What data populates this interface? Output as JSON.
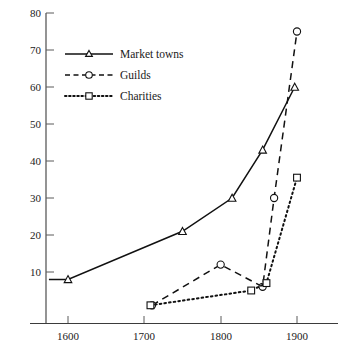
{
  "chart_data": {
    "type": "line",
    "title": "",
    "subtitle": "",
    "xlabel": "",
    "ylabel": "",
    "xlim": [
      1560,
      1935
    ],
    "ylim": [
      0,
      80
    ],
    "grid": false,
    "legend_position": "upper-left-inside",
    "xticks": [
      1600,
      1700,
      1800,
      1900
    ],
    "xtick_labels": [
      "1600",
      "1700",
      "1800",
      "1900"
    ],
    "yticks": [
      10,
      20,
      30,
      40,
      50,
      60,
      70,
      80
    ],
    "ytick_labels": [
      "10",
      "20",
      "30",
      "40",
      "50",
      "60",
      "70",
      "80"
    ],
    "series": [
      {
        "name": "Market towns",
        "marker": "triangle",
        "linestyle": "solid",
        "x": [
          1575,
          1600,
          1750,
          1815,
          1855,
          1897
        ],
        "values": [
          8,
          8,
          21,
          30,
          43,
          60
        ]
      },
      {
        "name": "Guilds",
        "marker": "circle",
        "linestyle": "dashed",
        "x": [
          1710,
          1800,
          1855,
          1870,
          1900
        ],
        "values": [
          1,
          12,
          6,
          30,
          75
        ]
      },
      {
        "name": "Charities",
        "marker": "square",
        "linestyle": "dotted",
        "x": [
          1708,
          1840,
          1860,
          1900
        ],
        "values": [
          1,
          5,
          7,
          35.5
        ]
      }
    ]
  },
  "legend": {
    "items": [
      {
        "label": "Market towns",
        "marker": "triangle-marker",
        "linestyle": "solid"
      },
      {
        "label": "Guilds",
        "marker": "circle-marker",
        "linestyle": "dashed"
      },
      {
        "label": "Charities",
        "marker": "square-marker",
        "linestyle": "dotted"
      }
    ]
  },
  "axes": {
    "y_tick_80": "80",
    "y_tick_70": "70",
    "y_tick_60": "60",
    "y_tick_50": "50",
    "y_tick_40": "40",
    "y_tick_30": "30",
    "y_tick_20": "20",
    "y_tick_10": "10",
    "x_tick_1600": "1600",
    "x_tick_1700": "1700",
    "x_tick_1800": "1800",
    "x_tick_1900": "1900"
  },
  "colors": {
    "ink": "#111111",
    "axis": "#3b3b3b",
    "background": "#ffffff"
  }
}
